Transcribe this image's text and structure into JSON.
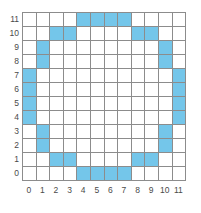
{
  "chart_data": {
    "type": "heatmap",
    "title": "",
    "xlabel": "",
    "ylabel": "",
    "grid": true,
    "legend": "none",
    "xlim": [
      0,
      11
    ],
    "ylim": [
      0,
      11
    ],
    "x_tick_labels": [
      "0",
      "1",
      "2",
      "3",
      "4",
      "5",
      "6",
      "7",
      "8",
      "9",
      "10",
      "11"
    ],
    "y_tick_labels": [
      "11",
      "10",
      "9",
      "8",
      "7",
      "6",
      "5",
      "4",
      "3",
      "2",
      "1",
      "0"
    ],
    "columns": 12,
    "rows": 12,
    "fill_color": "#74c6ea",
    "empty_color": "#ffffff",
    "grid_line_color": "#8c8c8c",
    "filled_cells_by_row": [
      {
        "y": 11,
        "x": [
          4,
          5,
          6,
          7
        ]
      },
      {
        "y": 10,
        "x": [
          2,
          3,
          8,
          9
        ]
      },
      {
        "y": 9,
        "x": [
          1,
          10
        ]
      },
      {
        "y": 8,
        "x": [
          1,
          10
        ]
      },
      {
        "y": 7,
        "x": [
          0,
          11
        ]
      },
      {
        "y": 6,
        "x": [
          0,
          11
        ]
      },
      {
        "y": 5,
        "x": [
          0,
          11
        ]
      },
      {
        "y": 4,
        "x": [
          0,
          11
        ]
      },
      {
        "y": 3,
        "x": [
          1,
          10
        ]
      },
      {
        "y": 2,
        "x": [
          1,
          10
        ]
      },
      {
        "y": 1,
        "x": [
          2,
          3,
          8,
          9
        ]
      },
      {
        "y": 0,
        "x": [
          4,
          5,
          6,
          7
        ]
      }
    ],
    "matrix_top_to_bottom": [
      [
        0,
        0,
        0,
        0,
        1,
        1,
        1,
        1,
        0,
        0,
        0,
        0
      ],
      [
        0,
        0,
        1,
        1,
        0,
        0,
        0,
        0,
        1,
        1,
        0,
        0
      ],
      [
        0,
        1,
        0,
        0,
        0,
        0,
        0,
        0,
        0,
        0,
        1,
        0
      ],
      [
        0,
        1,
        0,
        0,
        0,
        0,
        0,
        0,
        0,
        0,
        1,
        0
      ],
      [
        1,
        0,
        0,
        0,
        0,
        0,
        0,
        0,
        0,
        0,
        0,
        1
      ],
      [
        1,
        0,
        0,
        0,
        0,
        0,
        0,
        0,
        0,
        0,
        0,
        1
      ],
      [
        1,
        0,
        0,
        0,
        0,
        0,
        0,
        0,
        0,
        0,
        0,
        1
      ],
      [
        1,
        0,
        0,
        0,
        0,
        0,
        0,
        0,
        0,
        0,
        0,
        1
      ],
      [
        0,
        1,
        0,
        0,
        0,
        0,
        0,
        0,
        0,
        0,
        1,
        0
      ],
      [
        0,
        1,
        0,
        0,
        0,
        0,
        0,
        0,
        0,
        0,
        1,
        0
      ],
      [
        0,
        0,
        1,
        1,
        0,
        0,
        0,
        0,
        1,
        1,
        0,
        0
      ],
      [
        0,
        0,
        0,
        0,
        1,
        1,
        1,
        1,
        0,
        0,
        0,
        0
      ]
    ],
    "filled_count": 32
  }
}
